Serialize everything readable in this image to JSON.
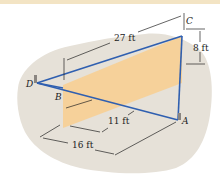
{
  "figure": {
    "points": {
      "A": "A",
      "B": "B",
      "C": "C",
      "D": "D"
    },
    "dimensions": {
      "dim_27": "27 ft",
      "dim_8": "8 ft",
      "dim_11": "11 ft",
      "dim_16": "16 ft"
    },
    "colors": {
      "cable": "#2f5fb0",
      "panel": "#f7cf94",
      "ground": "#e6e1d8",
      "background_band": "#f3e4c4",
      "dimension_lines": "#222222"
    }
  }
}
